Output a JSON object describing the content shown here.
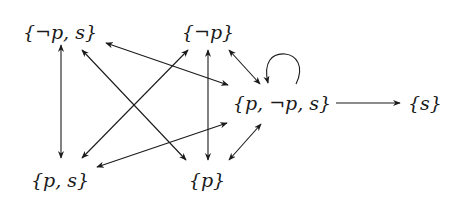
{
  "diagram": {
    "type": "state-transition-graph",
    "nodes": [
      {
        "id": "neg_p_s",
        "label": "{¬p, s}",
        "x": 60,
        "y": 32
      },
      {
        "id": "neg_p",
        "label": "{¬p}",
        "x": 208,
        "y": 32
      },
      {
        "id": "p_neg_p_s",
        "label": "{p, ¬p, s}",
        "x": 282,
        "y": 103
      },
      {
        "id": "s",
        "label": "{s}",
        "x": 425,
        "y": 103
      },
      {
        "id": "p_s",
        "label": "{p, s}",
        "x": 60,
        "y": 180
      },
      {
        "id": "p",
        "label": "{p}",
        "x": 207,
        "y": 180
      }
    ],
    "edges": [
      {
        "from": "neg_p_s",
        "to": "p_s",
        "bidirectional": true
      },
      {
        "from": "neg_p_s",
        "to": "p",
        "bidirectional": true
      },
      {
        "from": "neg_p_s",
        "to": "p_neg_p_s",
        "bidirectional": true
      },
      {
        "from": "neg_p",
        "to": "p_s",
        "bidirectional": true
      },
      {
        "from": "neg_p",
        "to": "p",
        "bidirectional": true
      },
      {
        "from": "neg_p",
        "to": "p_neg_p_s",
        "bidirectional": true
      },
      {
        "from": "p_s",
        "to": "p_neg_p_s",
        "bidirectional": true
      },
      {
        "from": "p",
        "to": "p_neg_p_s",
        "bidirectional": true
      },
      {
        "from": "p_neg_p_s",
        "to": "s",
        "bidirectional": false
      },
      {
        "from": "p_neg_p_s",
        "to": "p_neg_p_s",
        "self_loop": true
      }
    ],
    "colors": {
      "stroke": "#1a1a1a",
      "background": "#ffffff"
    }
  }
}
